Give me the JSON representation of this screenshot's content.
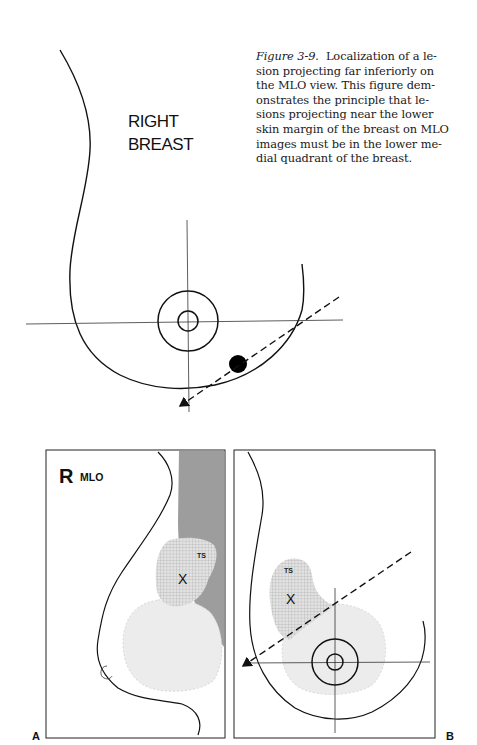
{
  "caption": {
    "figure_label": "Figure 3-9.",
    "text": "Localization of a lesion projecting far inferiorly on the MLO view. This figure demonstrates the principle that lesions projecting near the lower skin margin of the breast on MLO images must be in the lower medial quadrant of the breast.",
    "lines": [
      "Localization of a le-",
      "sion projecting far inferiorly on",
      "the MLO view. This figure dem-",
      "onstrates the principle that le-",
      "sions projecting near the lower",
      "skin margin of the breast on MLO",
      "images must be in the lower me-",
      "dial quadrant of the breast."
    ]
  },
  "top_diagram": {
    "label_line1": "RIGHT",
    "label_line2": "BREAST"
  },
  "panel_a": {
    "panel_letter": "A",
    "side_letter": "R",
    "view_label": "MLO",
    "region_label": "TS",
    "lesion_mark": "X"
  },
  "panel_b": {
    "panel_letter": "B",
    "region_label": "TS",
    "lesion_mark": "X"
  },
  "colors": {
    "ink": "#111111",
    "pectoral_gray": "#9a9a9a",
    "checker_fill": "#cfcfcf",
    "light_fill": "#ececec"
  }
}
